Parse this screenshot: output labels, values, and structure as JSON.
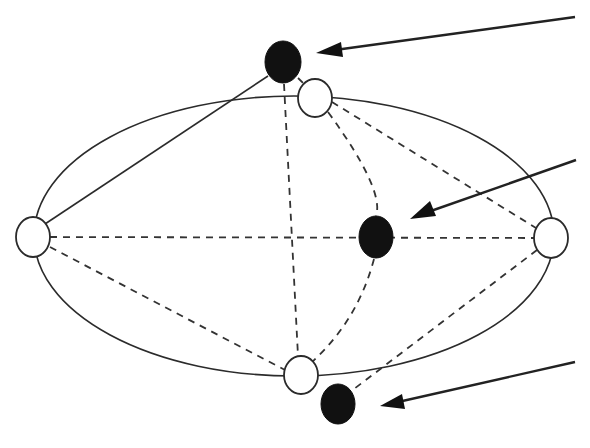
{
  "diagram": {
    "colors": {
      "background": "#ffffff",
      "stroke": "#2b2b2b",
      "filled_node": "#111111",
      "open_node_fill": "#ffffff"
    },
    "ellipse": {
      "cx": 294,
      "cy": 236,
      "rx": 260,
      "ry": 140
    },
    "open_nodes": [
      {
        "id": "top",
        "cx": 315,
        "cy": 98,
        "rx": 17,
        "ry": 19
      },
      {
        "id": "left",
        "cx": 33,
        "cy": 237,
        "rx": 17,
        "ry": 20
      },
      {
        "id": "right",
        "cx": 551,
        "cy": 238,
        "rx": 17,
        "ry": 20
      },
      {
        "id": "bottom",
        "cx": 301,
        "cy": 375,
        "rx": 17,
        "ry": 19
      }
    ],
    "filled_nodes": [
      {
        "id": "top",
        "cx": 283,
        "cy": 62,
        "rx": 18,
        "ry": 21
      },
      {
        "id": "middle",
        "cx": 376,
        "cy": 237,
        "rx": 17,
        "ry": 21
      },
      {
        "id": "bottom",
        "cx": 338,
        "cy": 404,
        "rx": 17,
        "ry": 20
      }
    ],
    "arrows": [
      {
        "id": "arrow-top",
        "from": [
          575,
          17
        ],
        "to": [
          316,
          53
        ],
        "target": "filled-top"
      },
      {
        "id": "arrow-middle",
        "from": [
          576,
          160
        ],
        "to": [
          410,
          218
        ],
        "target": "filled-middle"
      },
      {
        "id": "arrow-bottom",
        "from": [
          575,
          362
        ],
        "to": [
          380,
          406
        ],
        "target": "filled-bottom"
      }
    ],
    "edges": [
      {
        "style": "solid",
        "from": "open-left",
        "to": "filled-top"
      },
      {
        "style": "dashed",
        "from": "open-left",
        "to": "open-right"
      },
      {
        "style": "dashed",
        "from": "open-left",
        "to": "open-bottom"
      },
      {
        "style": "dashed",
        "from": "open-top",
        "to": "open-right"
      },
      {
        "style": "dashed",
        "from": "filled-top",
        "to": "open-bottom"
      },
      {
        "style": "dashed",
        "from": "filled-top",
        "to": "open-top"
      },
      {
        "style": "dashed-arc",
        "from": "open-top",
        "via": "filled-middle",
        "to": "open-bottom"
      },
      {
        "style": "dashed",
        "from": "open-right",
        "to": "filled-bottom"
      }
    ]
  }
}
